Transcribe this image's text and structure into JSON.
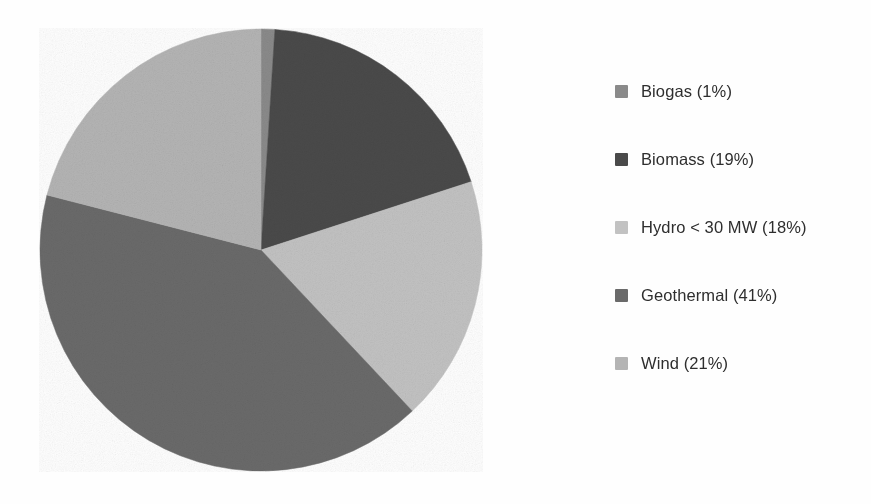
{
  "chart_data": {
    "type": "pie",
    "title": "",
    "subtitle": "",
    "xlabel": "",
    "ylabel": "",
    "units": "percent",
    "start_angle_deg": 0,
    "direction": "clockwise",
    "legend_position": "right",
    "grid": false,
    "background_color": "#ffffff",
    "text_color": "#2e2e2e",
    "categories": [
      "Biogas",
      "Biomass",
      "Hydro < 30 MW",
      "Geothermal",
      "Wind"
    ],
    "values": [
      1,
      19,
      18,
      41,
      21
    ],
    "colors": [
      "#8a8a8a",
      "#4a4a4a",
      "#c2c2c2",
      "#6a6a6a",
      "#b4b4b4"
    ],
    "slices": [
      {
        "name": "Biogas",
        "value": 1,
        "label": "Biogas (1%)",
        "color": "#8a8a8a",
        "start_deg": 0.0,
        "end_deg": 3.6
      },
      {
        "name": "Biomass",
        "value": 19,
        "label": "Biomass (19%)",
        "color": "#4a4a4a",
        "start_deg": 3.6,
        "end_deg": 72.0
      },
      {
        "name": "Hydro < 30 MW",
        "value": 18,
        "label": "Hydro < 30 MW (18%)",
        "color": "#c2c2c2",
        "start_deg": 72.0,
        "end_deg": 136.8
      },
      {
        "name": "Geothermal",
        "value": 41,
        "label": "Geothermal (41%)",
        "color": "#6a6a6a",
        "start_deg": 136.8,
        "end_deg": 284.4
      },
      {
        "name": "Wind",
        "value": 21,
        "label": "Wind (21%)",
        "color": "#b4b4b4",
        "start_deg": 284.4,
        "end_deg": 360.0
      }
    ]
  },
  "legend": {
    "items": [
      {
        "label": "Biogas (1%)",
        "color": "#8a8a8a",
        "swatch_name": "legend-swatch-biogas"
      },
      {
        "label": "Biomass (19%)",
        "color": "#4a4a4a",
        "swatch_name": "legend-swatch-biomass"
      },
      {
        "label": "Hydro < 30 MW (18%)",
        "color": "#c2c2c2",
        "swatch_name": "legend-swatch-hydro"
      },
      {
        "label": "Geothermal (41%)",
        "color": "#6a6a6a",
        "swatch_name": "legend-swatch-geothermal"
      },
      {
        "label": "Wind (21%)",
        "color": "#b4b4b4",
        "swatch_name": "legend-swatch-wind"
      }
    ]
  }
}
